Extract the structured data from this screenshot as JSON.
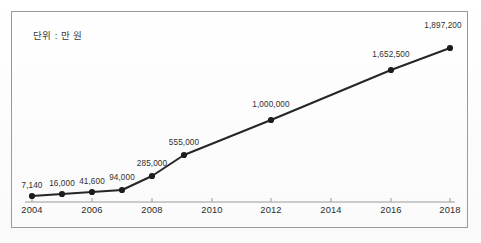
{
  "annotation": {
    "unit_note": "단위 : 만 원"
  },
  "chart_data": {
    "type": "line",
    "title": "",
    "subtitle": "",
    "xlabel": "",
    "ylabel": "",
    "unit_note": "단위 : 만 원",
    "grid": false,
    "legend": "none",
    "x": [
      2004,
      2005,
      2006,
      2007,
      2008,
      2009,
      2012,
      2016,
      2018
    ],
    "values": [
      7140,
      16000,
      41600,
      94000,
      285000,
      555000,
      1000000,
      1652500,
      1897200
    ],
    "point_labels": [
      "7,140",
      "16,000",
      "41,600",
      "94,000",
      "285,000",
      "555,000",
      "1,000,000",
      "1,652,500",
      "1,897,200"
    ],
    "xlim": [
      2004,
      2018
    ],
    "ylim": [
      0,
      1897200
    ],
    "x_tick_labels": [
      "2004",
      "2006",
      "2008",
      "2010",
      "2012",
      "2014",
      "2016",
      "2018"
    ],
    "x_tick_values": [
      2004,
      2006,
      2008,
      2010,
      2012,
      2014,
      2016,
      2018
    ],
    "series": [
      {
        "name": "",
        "marker": "filled-circle",
        "line_color": "#262626",
        "marker_color": "#1c1c1c",
        "values": [
          7140,
          16000,
          41600,
          94000,
          285000,
          555000,
          1000000,
          1652500,
          1897200
        ]
      }
    ],
    "colors": {
      "line": "#262626",
      "marker": "#1c1c1c",
      "axis": "#9a9a9a",
      "frame": "#9a9a9a",
      "label_text": "#2f2f2f",
      "background": "#fdfdfd"
    }
  },
  "layout": {
    "point_px": [
      {
        "x": 32,
        "y": 196,
        "label_x": 32,
        "label_y": 190
      },
      {
        "x": 62,
        "y": 194,
        "label_x": 62,
        "label_y": 188
      },
      {
        "x": 92,
        "y": 192,
        "label_x": 92,
        "label_y": 186
      },
      {
        "x": 122,
        "y": 190,
        "label_x": 122,
        "label_y": 182
      },
      {
        "x": 152,
        "y": 176,
        "label_x": 152,
        "label_y": 168
      },
      {
        "x": 184,
        "y": 155,
        "label_x": 184,
        "label_y": 147
      },
      {
        "x": 271,
        "y": 120,
        "label_x": 271,
        "label_y": 109
      },
      {
        "x": 391,
        "y": 70,
        "label_x": 391,
        "label_y": 59
      },
      {
        "x": 450,
        "y": 48,
        "label_x": 443,
        "label_y": 30
      }
    ],
    "x_tick_px": [
      32,
      92,
      152,
      212,
      271,
      331,
      391,
      450
    ],
    "axis_y_px": 202,
    "axis_x_start_px": 25,
    "axis_x_end_px": 455
  }
}
